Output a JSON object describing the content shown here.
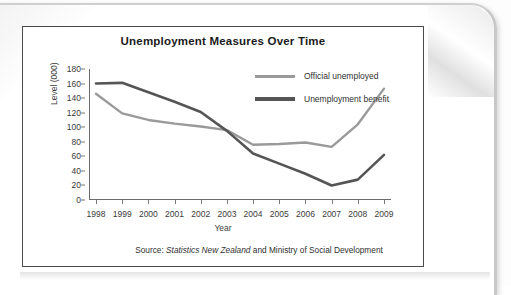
{
  "chart_data": {
    "type": "line",
    "title": "Unemployment Measures Over Time",
    "xlabel": "Year",
    "ylabel": "Level (000)",
    "categories": [
      "1998",
      "1999",
      "2000",
      "2001",
      "2002",
      "2003",
      "2004",
      "2005",
      "2006",
      "2007",
      "2008",
      "2009"
    ],
    "ylim": [
      0,
      180
    ],
    "yticks": [
      0,
      20,
      40,
      60,
      80,
      100,
      120,
      140,
      160,
      180
    ],
    "grid": false,
    "legend_position": "top-right-inside",
    "series": [
      {
        "name": "Official unemployed",
        "color": "#9a9a9a",
        "values": [
          146,
          119,
          110,
          105,
          101,
          96,
          76,
          77,
          79,
          73,
          104,
          153
        ]
      },
      {
        "name": "Unemployment benefit",
        "color": "#555555",
        "values": [
          160,
          161,
          148,
          135,
          121,
          95,
          64,
          50,
          36,
          20,
          28,
          62
        ]
      }
    ],
    "source_prefix": "Source: ",
    "source_italic": "Statistics New Zealand",
    "source_suffix": " and Ministry of Social Development"
  },
  "figure": {
    "title": "Unemployment Measures Over Time",
    "axis_x_title": "Year",
    "axis_y_title": "Level (000)"
  }
}
